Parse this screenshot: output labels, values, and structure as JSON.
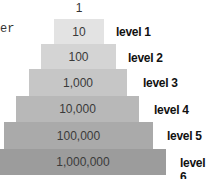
{
  "fragment_text": "er",
  "top_value": "1",
  "levels": [
    {
      "value": "10",
      "label": "level 1",
      "color": "#e3e3e3"
    },
    {
      "value": "100",
      "label": "level 2",
      "color": "#d4d4d4"
    },
    {
      "value": "1,000",
      "label": "level 3",
      "color": "#c6c6c6"
    },
    {
      "value": "10,000",
      "label": "level 4",
      "color": "#b8b8b8"
    },
    {
      "value": "100,000",
      "label": "level 5",
      "color": "#aaaaaa"
    },
    {
      "value": "1,000,000",
      "label": "level 6",
      "color": "#9c9c9c"
    }
  ]
}
